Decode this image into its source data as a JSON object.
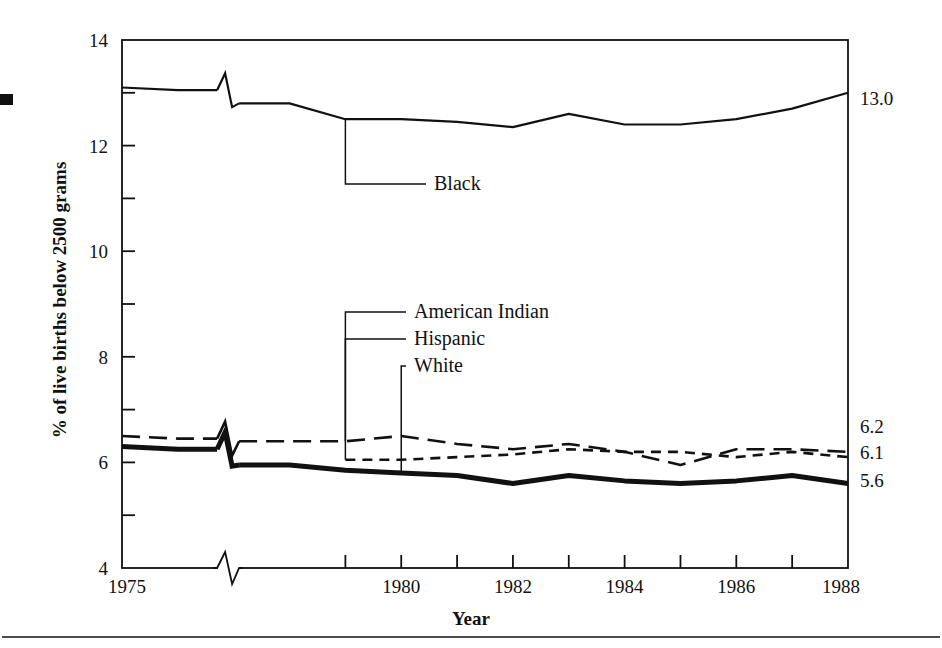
{
  "figure": {
    "background_color": "#ffffff",
    "ink_color": "#111111",
    "bullet_marker": "filled-square",
    "footer_rule": true
  },
  "chart_data": {
    "type": "line",
    "title": "",
    "subtitle": "",
    "xlabel": "Year",
    "ylabel": "% of live births below 2500 grams",
    "xlim": [
      1975,
      1988
    ],
    "ylim": [
      4,
      14
    ],
    "grid": false,
    "legend_position": "inline-callouts",
    "axis_break_x": true,
    "axis_break_note": "zig-zag break between 1975 and 1978 on the x-axis and on each series",
    "x_major_ticks": [
      1975,
      1980,
      1982,
      1984,
      1986,
      1988
    ],
    "x_major_tick_labels": [
      "1975",
      "1980",
      "1982",
      "1984",
      "1986",
      "1988"
    ],
    "x_minor_ticks": [
      1979,
      1981,
      1983,
      1985,
      1987
    ],
    "y_major_ticks": [
      4,
      6,
      8,
      10,
      12,
      14
    ],
    "y_major_tick_labels": [
      "4",
      "6",
      "8",
      "10",
      "12",
      "14"
    ],
    "y_minor_ticks": [
      5,
      7,
      9,
      11,
      13
    ],
    "x": [
      1975,
      1976,
      1978,
      1979,
      1980,
      1981,
      1982,
      1983,
      1984,
      1985,
      1986,
      1987,
      1988
    ],
    "series": [
      {
        "name": "Black",
        "label": "Black",
        "style": "solid-thin",
        "stroke_width": 2.2,
        "dash": "none",
        "end_value_label": "13.0",
        "values": [
          13.1,
          13.05,
          12.8,
          12.5,
          12.5,
          12.45,
          12.35,
          12.6,
          12.4,
          12.4,
          12.5,
          12.7,
          13.0
        ]
      },
      {
        "name": "American Indian",
        "label": "American Indian",
        "style": "long-dash",
        "stroke_width": 2.6,
        "dash": "18,9",
        "end_value_label": "6.2",
        "values": [
          6.5,
          6.45,
          6.4,
          6.4,
          6.5,
          6.35,
          6.25,
          6.35,
          6.2,
          5.95,
          6.25,
          6.25,
          6.2
        ]
      },
      {
        "name": "Hispanic",
        "label": "Hispanic",
        "style": "short-dash",
        "stroke_width": 2.6,
        "dash": "10,7",
        "start_year": 1979,
        "end_value_label": "6.1",
        "values": [
          null,
          null,
          null,
          6.05,
          6.05,
          6.1,
          6.15,
          6.25,
          6.2,
          6.2,
          6.1,
          6.2,
          6.1
        ]
      },
      {
        "name": "White",
        "label": "White",
        "style": "solid-thick",
        "stroke_width": 5.0,
        "dash": "none",
        "end_value_label": "5.6",
        "values": [
          6.3,
          6.25,
          5.95,
          5.85,
          5.8,
          5.75,
          5.6,
          5.75,
          5.65,
          5.6,
          5.65,
          5.75,
          5.6
        ]
      }
    ],
    "callouts": [
      {
        "label": "Black",
        "series": "Black",
        "anchor_year": 1979,
        "anchor_value": 12.5,
        "text_x": 434,
        "text_y": 190
      },
      {
        "label": "American Indian",
        "series": "American Indian",
        "anchor_year": 1979,
        "anchor_value": 6.4,
        "text_x": 414,
        "text_y": 318
      },
      {
        "label": "Hispanic",
        "series": "Hispanic",
        "anchor_year": 1979,
        "anchor_value": 6.05,
        "text_x": 414,
        "text_y": 345
      },
      {
        "label": "White",
        "series": "White",
        "anchor_year": 1980,
        "anchor_value": 5.8,
        "text_x": 414,
        "text_y": 372
      }
    ],
    "end_labels": [
      {
        "text": "13.0",
        "x": 860,
        "y": 105
      },
      {
        "text": "6.2",
        "x": 860,
        "y": 433
      },
      {
        "text": "6.1",
        "x": 860,
        "y": 459
      },
      {
        "text": "5.6",
        "x": 860,
        "y": 487
      }
    ]
  }
}
